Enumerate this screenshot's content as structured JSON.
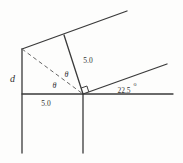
{
  "diagram": {
    "type": "geometry-figure",
    "labels": {
      "d_label": "d",
      "upper_length": "5.0",
      "lower_length": "5.0",
      "angle_value": "22.5",
      "degree_symbol": "o",
      "theta_upper": "θ",
      "theta_lower": "θ"
    },
    "colors": {
      "line": "#3a3a3a",
      "dashed_line": "#666666",
      "text": "#333333",
      "background": "#fdfdfc"
    }
  }
}
